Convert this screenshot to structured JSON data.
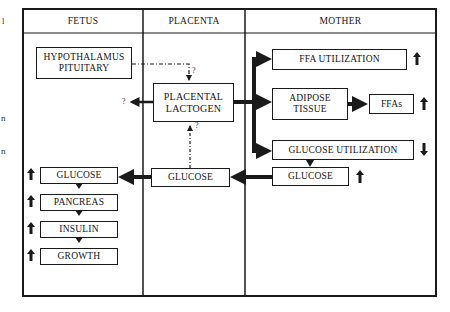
{
  "columns": {
    "fetus": "FETUS",
    "placenta": "PLACENTA",
    "mother": "MOTHER"
  },
  "fetus": {
    "hypothalamus": [
      "HYPOTHALAMUS",
      "PITUITARY"
    ],
    "chain": [
      {
        "label": "GLUCOSE",
        "trend": "up"
      },
      {
        "label": "PANCREAS",
        "trend": "up"
      },
      {
        "label": "INSULIN",
        "trend": "up"
      },
      {
        "label": "GROWTH",
        "trend": "up"
      }
    ]
  },
  "placenta": {
    "lactogen": [
      "PLACENTAL",
      "LACTOGEN"
    ],
    "glucose": "GLUCOSE",
    "question_marks": [
      "?",
      "?",
      "?"
    ]
  },
  "mother": {
    "ffa_utilization": {
      "label": "FFA UTILIZATION",
      "trend": "up"
    },
    "adipose": [
      "ADIPOSE",
      "TISSUE"
    ],
    "ffas": {
      "label": "FFAs",
      "trend": "up"
    },
    "glucose_utilization": {
      "label": "GLUCOSE UTILIZATION",
      "trend": "down"
    },
    "glucose": {
      "label": "GLUCOSE",
      "trend": "up"
    }
  },
  "margin_fragments": [
    "l",
    "n",
    "n"
  ],
  "colors": {
    "line": "#1a1a1a",
    "background": "#ffffff"
  }
}
